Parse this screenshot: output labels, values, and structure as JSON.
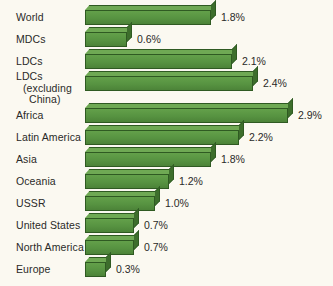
{
  "chart_data": {
    "type": "bar",
    "orientation": "horizontal",
    "title": "",
    "subtitle": "",
    "xlabel": "",
    "ylabel": "",
    "unit": "%",
    "xlim": [
      0,
      3.0
    ],
    "grid": false,
    "legend": null,
    "value_label_suffix": "%",
    "bar_color": "#579341",
    "bar_top_color": "#6fa954",
    "bar_side_color": "#3d6e2c",
    "bar_edge_color": "#2f5a22",
    "background_color": "#fbf9f1",
    "text_color": "#2a2a28",
    "categories": [
      "World",
      "MDCs",
      "LDCs",
      "LDCs (excluding China)",
      "Africa",
      "Latin America",
      "Asia",
      "Oceania",
      "USSR",
      "United States",
      "North America",
      "Europe"
    ],
    "values": [
      1.8,
      0.6,
      2.1,
      2.4,
      2.9,
      2.2,
      1.8,
      1.2,
      1.0,
      0.7,
      0.7,
      0.3
    ],
    "value_labels": [
      "1.8%",
      "0.6%",
      "2.1%",
      "2.4%",
      "2.9%",
      "2.2%",
      "1.8%",
      "1.2%",
      "1.0%",
      "0.7%",
      "0.7%",
      "0.3%"
    ],
    "groups": [
      {
        "name": "development-groups",
        "indices": [
          0,
          1,
          2,
          3
        ]
      },
      {
        "name": "regions",
        "indices": [
          4,
          5,
          6,
          7,
          8,
          9,
          10,
          11
        ]
      }
    ]
  },
  "rows": [
    {
      "label_lines": [
        "World"
      ],
      "indent": 0,
      "value_label": "1.8%",
      "value": 1.8
    },
    {
      "label_lines": [
        "MDCs"
      ],
      "indent": 0,
      "value_label": "0.6%",
      "value": 0.6
    },
    {
      "label_lines": [
        "LDCs"
      ],
      "indent": 0,
      "value_label": "2.1%",
      "value": 2.1
    },
    {
      "label_lines": [
        "LDCs",
        "(excluding",
        "China)"
      ],
      "indent": 0,
      "value_label": "2.4%",
      "value": 2.4
    },
    {
      "label_lines": [
        "Africa"
      ],
      "indent": 0,
      "value_label": "2.9%",
      "value": 2.9
    },
    {
      "label_lines": [
        "Latin America"
      ],
      "indent": 0,
      "value_label": "2.2%",
      "value": 2.2
    },
    {
      "label_lines": [
        "Asia"
      ],
      "indent": 0,
      "value_label": "1.8%",
      "value": 1.8
    },
    {
      "label_lines": [
        "Oceania"
      ],
      "indent": 0,
      "value_label": "1.2%",
      "value": 1.2
    },
    {
      "label_lines": [
        "USSR"
      ],
      "indent": 0,
      "value_label": "1.0%",
      "value": 1.0
    },
    {
      "label_lines": [
        "United States"
      ],
      "indent": 0,
      "value_label": "0.7%",
      "value": 0.7
    },
    {
      "label_lines": [
        "North America"
      ],
      "indent": 0,
      "value_label": "0.7%",
      "value": 0.7
    },
    {
      "label_lines": [
        "Europe"
      ],
      "indent": 0,
      "value_label": "0.3%",
      "value": 0.3
    }
  ],
  "layout": {
    "bar_origin_x": 85,
    "px_per_unit": 70,
    "row_height": 22,
    "group_gap": 10,
    "first_row_top": 6
  }
}
